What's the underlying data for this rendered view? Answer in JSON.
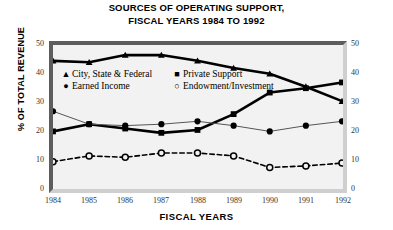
{
  "title": {
    "line1": "SOURCES OF OPERATING SUPPORT,",
    "line2": "FISCAL YEARS 1984 TO 1992"
  },
  "axes": {
    "ylabel": "% OF TOTAL REVENUE",
    "xlabel": "FISCAL YEARS",
    "yticks": [
      "0",
      "10",
      "20",
      "30",
      "40",
      "50"
    ],
    "xticks": [
      "1984",
      "1985",
      "1986",
      "1987",
      "1988",
      "1989",
      "1990",
      "1991",
      "1992"
    ]
  },
  "legend": {
    "items": [
      {
        "marker": "▲",
        "label": "City, State & Federal"
      },
      {
        "marker": "■",
        "label": "Private Support"
      },
      {
        "marker": "●",
        "label": "Earned Income"
      },
      {
        "marker": "○",
        "label": "Endowment/Investment"
      }
    ]
  },
  "chart_data": {
    "type": "line",
    "title": "SOURCES OF OPERATING SUPPORT, FISCAL YEARS 1984 TO 1992",
    "xlabel": "FISCAL YEARS",
    "ylabel": "% OF TOTAL REVENUE",
    "categories": [
      "1984",
      "1985",
      "1986",
      "1987",
      "1988",
      "1989",
      "1990",
      "1991",
      "1992"
    ],
    "x": [
      1984,
      1985,
      1986,
      1987,
      1988,
      1989,
      1990,
      1991,
      1992
    ],
    "ylim": [
      0,
      50
    ],
    "ytick_interval": 10,
    "grid": false,
    "legend_position": "upper-left-inside",
    "dual_y_axis": true,
    "series": [
      {
        "name": "City, State & Federal",
        "marker": "triangle",
        "line_style": "solid",
        "line_weight": "thick",
        "color": "#000000",
        "values": [
          44.5,
          44,
          46.5,
          46.5,
          44.5,
          42,
          40,
          35.5,
          30.5
        ]
      },
      {
        "name": "Private Support",
        "marker": "square",
        "line_style": "solid",
        "line_weight": "thick",
        "color": "#000000",
        "values": [
          20,
          22.5,
          21,
          19.5,
          20.5,
          26,
          33.5,
          35,
          37
        ]
      },
      {
        "name": "Earned Income",
        "marker": "circle-filled",
        "line_style": "solid",
        "line_weight": "thin",
        "color": "#555555",
        "values": [
          27,
          22.5,
          22,
          22.5,
          23.5,
          22,
          20,
          22,
          23.5
        ]
      },
      {
        "name": "Endowment/Investment",
        "marker": "circle-open",
        "line_style": "dashed",
        "line_weight": "medium",
        "color": "#000000",
        "values": [
          9.5,
          11.5,
          11,
          12.5,
          12.5,
          11.5,
          7.5,
          8,
          9
        ]
      }
    ]
  }
}
